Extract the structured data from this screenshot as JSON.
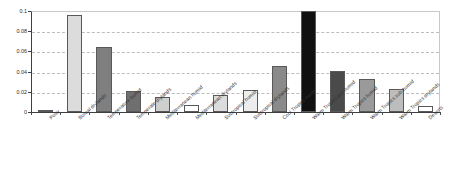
{
  "chart_data": {
    "type": "bar",
    "title": "",
    "subtitle": "",
    "xlabel": "",
    "ylabel": "",
    "ylim": [
      0,
      0.1
    ],
    "ytick_labels": [
      "0",
      "0.02",
      "0.04",
      "0.06",
      "0.08",
      "0.1"
    ],
    "ytick_values": [
      0,
      0.02,
      0.04,
      0.06,
      0.08,
      0.1
    ],
    "grid": true,
    "grid_style": "dashed-horizontal",
    "legend": "none",
    "categories": [
      "Polar",
      "Boreal drylands",
      "Temperature humid",
      "Temperate drylands",
      "Mediterranean humid",
      "Mediterranean drylands",
      "Subtropical humid",
      "Subtropical drylands",
      "Cool Tropics moist",
      "Warm Tropics per-humid",
      "Warm Tropics humid",
      "Warm Tropics sub-humid",
      "Warm Tropics drylands",
      "Deserts"
    ],
    "values": [
      0.001,
      0.096,
      0.064,
      0.0205,
      0.0148,
      0.0073,
      0.0168,
      0.0222,
      0.0452,
      0.1,
      0.0405,
      0.0322,
      0.0232,
      0.0055
    ],
    "bar_colors": [
      "#9e9e9e",
      "#dcdcdc",
      "#7f7f7f",
      "#6f6f6f",
      "#cfcfcf",
      "#ffffff",
      "#dcdcdc",
      "#ededed",
      "#8a8a8a",
      "#111111",
      "#4a4a4a",
      "#9a9a9a",
      "#bdbdbd",
      "#ffffff"
    ],
    "bar_border_color": "#595959",
    "axis_color": "#3f3f3f",
    "gridline_color": "#bdbdbd",
    "background": "#ffffff"
  }
}
